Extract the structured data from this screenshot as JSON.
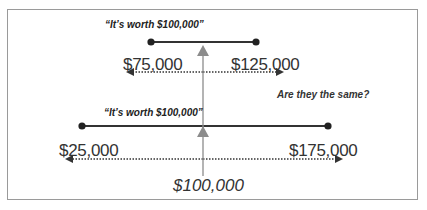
{
  "diagram": {
    "top": {
      "quote": "“It’s worth $100,000”",
      "low": "$75,000",
      "high": "$125,000"
    },
    "bottom": {
      "quote": "“It’s worth $100,000”",
      "low": "$25,000",
      "high": "$175,000"
    },
    "center_value": "$100,000",
    "question": "Are they the same?",
    "colors": {
      "range_line": "#333333",
      "dotted_line": "#333333",
      "center_arrow": "#8c8c8c",
      "border": "#9a9a9a"
    }
  }
}
